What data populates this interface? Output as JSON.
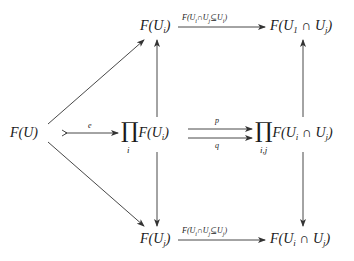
{
  "diagram": {
    "type": "commutative-diagram",
    "nodes": {
      "FU": {
        "text": "F(U)"
      },
      "FUi": {
        "pre": "F(U",
        "sub": "i",
        "post": ")"
      },
      "FUj": {
        "pre": "F(U",
        "sub": "j",
        "post": ")"
      },
      "prod_i": {
        "symbol": "∏",
        "index": "i",
        "pre": "F(U",
        "sub": "i",
        "post": ")"
      },
      "prod_ij": {
        "symbol": "∏",
        "index": "i,j",
        "pre": "F(U",
        "sub1": "i",
        "mid": " ∩ U",
        "sub2": "j",
        "post": ")"
      },
      "top_right": {
        "pre": "F(U",
        "sub1": "1",
        "mid": " ∩ U",
        "sub2": "j",
        "post": ")"
      },
      "bottom_right": {
        "pre": "F(U",
        "sub1": "i",
        "mid": " ∩ U",
        "sub2": "j",
        "post": ")"
      }
    },
    "edges": [
      {
        "from": "FU",
        "to": "FUi",
        "label": ""
      },
      {
        "from": "FU",
        "to": "prod_i",
        "label": "e",
        "style": "mono"
      },
      {
        "from": "FU",
        "to": "FUj",
        "label": ""
      },
      {
        "from": "prod_i",
        "to": "FUi",
        "label": ""
      },
      {
        "from": "prod_i",
        "to": "FUj",
        "label": ""
      },
      {
        "from": "prod_i",
        "to": "prod_ij",
        "label": "p"
      },
      {
        "from": "prod_i",
        "to": "prod_ij",
        "label": "q"
      },
      {
        "from": "FUi",
        "to": "top_right",
        "label": "F(Ui∩Uj⊆Ui)"
      },
      {
        "from": "FUj",
        "to": "bottom_right",
        "label": "F(Ui∩Uj⊆Uj)"
      },
      {
        "from": "prod_ij",
        "to": "top_right",
        "label": ""
      },
      {
        "from": "prod_ij",
        "to": "bottom_right",
        "label": ""
      }
    ],
    "labels": {
      "e": "e",
      "p": "p",
      "q": "q",
      "top": {
        "pre": "F(U",
        "s1": "i",
        "mid": "∩U",
        "s2": "j",
        "rel": "⊆U",
        "s3": "i",
        "post": ")"
      },
      "bottom": {
        "pre": "F(U",
        "s1": "i",
        "mid": "∩U",
        "s2": "j",
        "rel": "⊆U",
        "s3": "j",
        "post": ")"
      }
    }
  }
}
